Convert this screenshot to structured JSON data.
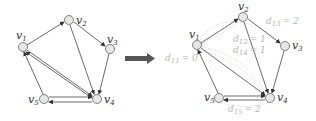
{
  "diagram": {
    "left_graph": {
      "nodes": [
        {
          "id": "v1",
          "label": "v",
          "sub": "1",
          "x": 23,
          "y": 47
        },
        {
          "id": "v2",
          "label": "v",
          "sub": "2",
          "x": 69,
          "y": 20
        },
        {
          "id": "v3",
          "label": "v",
          "sub": "3",
          "x": 110,
          "y": 49
        },
        {
          "id": "v4",
          "label": "v",
          "sub": "4",
          "x": 97,
          "y": 99
        },
        {
          "id": "v5",
          "label": "v",
          "sub": "5",
          "x": 44,
          "y": 99
        }
      ],
      "edges": [
        [
          "v1",
          "v2"
        ],
        [
          "v2",
          "v3"
        ],
        [
          "v2",
          "v4"
        ],
        [
          "v3",
          "v4"
        ],
        [
          "v1",
          "v4"
        ],
        [
          "v4",
          "v1"
        ],
        [
          "v5",
          "v1"
        ],
        [
          "v5",
          "v4"
        ],
        [
          "v4",
          "v5"
        ]
      ]
    },
    "arrow": {
      "color": "#555555"
    },
    "right_graph": {
      "nodes": [
        {
          "id": "v1",
          "label": "v",
          "sub": "1",
          "x": 197,
          "y": 45
        },
        {
          "id": "v2",
          "label": "v",
          "sub": "2",
          "x": 243,
          "y": 17
        },
        {
          "id": "v3",
          "label": "v",
          "sub": "3",
          "x": 285,
          "y": 46
        },
        {
          "id": "v4",
          "label": "v",
          "sub": "4",
          "x": 270,
          "y": 98
        },
        {
          "id": "v5",
          "label": "v",
          "sub": "5",
          "x": 219,
          "y": 98
        }
      ],
      "distance_labels": [
        {
          "text": "d",
          "sub": "11",
          "value": "= 0"
        },
        {
          "text": "d",
          "sub": "12",
          "value": "= 1"
        },
        {
          "text": "d",
          "sub": "14",
          "value": "= 1"
        },
        {
          "text": "d",
          "sub": "13",
          "value": "= 2"
        },
        {
          "text": "d",
          "sub": "15",
          "value": "= 2"
        }
      ]
    }
  }
}
